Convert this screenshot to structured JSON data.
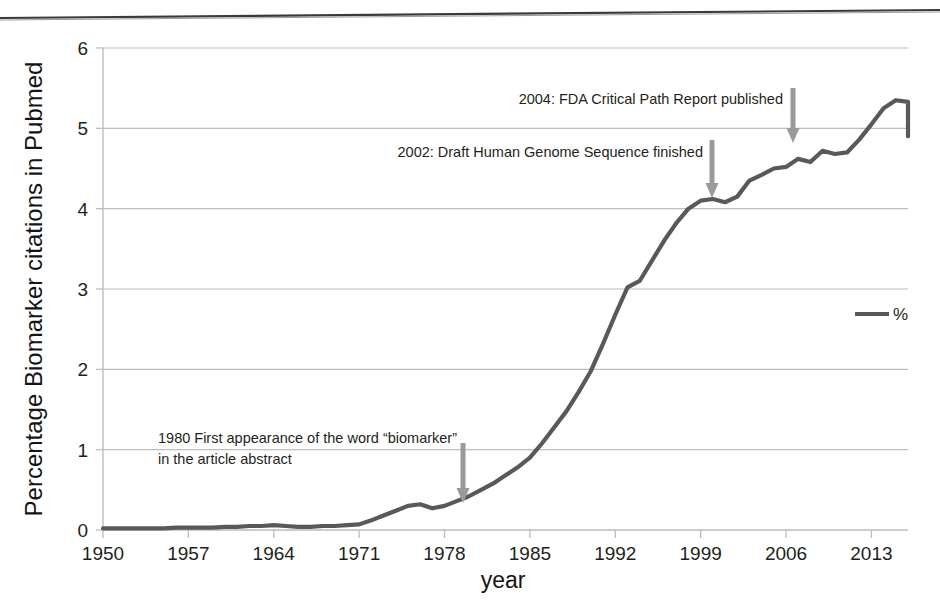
{
  "chart_data": {
    "type": "line",
    "title": "",
    "xlabel": "year",
    "ylabel": "Percentage Biomarker citations in Pubmed",
    "xlim": [
      1950,
      2016
    ],
    "ylim": [
      0,
      6
    ],
    "xticks": [
      "1950",
      "1957",
      "1964",
      "1971",
      "1978",
      "1985",
      "1992",
      "1999",
      "2006",
      "2013"
    ],
    "xtick_values": [
      1950,
      1957,
      1964,
      1971,
      1978,
      1985,
      1992,
      1999,
      2006,
      2013
    ],
    "yticks": [
      "0",
      "1",
      "2",
      "3",
      "4",
      "5",
      "6"
    ],
    "ytick_values": [
      0,
      1,
      2,
      3,
      4,
      5,
      6
    ],
    "grid": "horizontal",
    "legend_position": "right-middle",
    "series": [
      {
        "name": "%",
        "color": "#595959",
        "x": [
          1950,
          1951,
          1952,
          1953,
          1954,
          1955,
          1956,
          1957,
          1958,
          1959,
          1960,
          1961,
          1962,
          1963,
          1964,
          1965,
          1966,
          1967,
          1968,
          1969,
          1970,
          1971,
          1972,
          1973,
          1974,
          1975,
          1976,
          1977,
          1978,
          1979,
          1980,
          1981,
          1982,
          1983,
          1984,
          1985,
          1986,
          1987,
          1988,
          1989,
          1990,
          1991,
          1992,
          1993,
          1994,
          1995,
          1996,
          1997,
          1998,
          1999,
          2000,
          2001,
          2002,
          2003,
          2004,
          2005,
          2006,
          2007,
          2008,
          2009,
          2010,
          2011,
          2012,
          2013,
          2014,
          2015,
          2016
        ],
        "y": [
          0.02,
          0.02,
          0.02,
          0.02,
          0.02,
          0.02,
          0.03,
          0.03,
          0.03,
          0.03,
          0.04,
          0.04,
          0.05,
          0.05,
          0.06,
          0.05,
          0.04,
          0.04,
          0.05,
          0.05,
          0.06,
          0.07,
          0.12,
          0.18,
          0.24,
          0.3,
          0.32,
          0.27,
          0.3,
          0.36,
          0.42,
          0.5,
          0.58,
          0.68,
          0.78,
          0.9,
          1.08,
          1.28,
          1.48,
          1.72,
          1.98,
          2.32,
          2.68,
          3.02,
          3.1,
          3.35,
          3.6,
          3.82,
          4.0,
          4.1,
          4.12,
          4.08,
          4.15,
          4.35,
          4.42,
          4.5,
          4.52,
          4.62,
          4.58,
          4.72,
          4.68,
          4.7,
          4.86,
          5.05,
          5.25,
          5.35,
          5.33
        ],
        "y_final_drop": 4.9
      }
    ],
    "annotations": [
      {
        "id": "biomarker-1980",
        "lines": [
          "1980 First appearance of the word “biomarker”",
          "in the article abstract"
        ],
        "text_anchor": "start",
        "text_x": 158,
        "text_y": 443,
        "line_height": 21,
        "arrow_x": 463,
        "arrow_top_y": 443,
        "arrow_tip_y": 503,
        "arrow_color": "#9a9a9a"
      },
      {
        "id": "genome-2002",
        "lines": [
          "2002: Draft Human Genome Sequence finished"
        ],
        "text_anchor": "end",
        "text_x": 703,
        "text_y": 157,
        "line_height": 21,
        "arrow_x": 712,
        "arrow_top_y": 140,
        "arrow_tip_y": 198,
        "arrow_color": "#9a9a9a"
      },
      {
        "id": "fda-2004",
        "lines": [
          "2004: FDA Critical Path Report published"
        ],
        "text_anchor": "end",
        "text_x": 783,
        "text_y": 104,
        "line_height": 21,
        "arrow_x": 793,
        "arrow_top_y": 88,
        "arrow_tip_y": 143,
        "arrow_color": "#9a9a9a"
      }
    ],
    "legend": [
      {
        "label": "%",
        "color": "#595959"
      }
    ],
    "colors": {
      "line": "#595959",
      "grid": "#bdbdbd",
      "axis": "#bdbdbd",
      "text": "#231f20",
      "arrow": "#9a9a9a",
      "background": "#ffffff",
      "scan_artifact": "#3a3a3a"
    }
  }
}
